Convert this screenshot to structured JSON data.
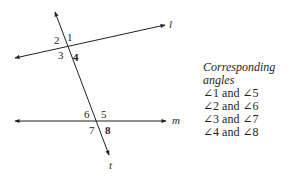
{
  "diagram": {
    "lines": {
      "l": {
        "label": "l"
      },
      "m": {
        "label": "m"
      },
      "t": {
        "label": "t"
      }
    },
    "angle_labels": {
      "a1": "1",
      "a2": "2",
      "a3": "3",
      "a4": "4",
      "a5": "5",
      "a6": "6",
      "a7": "7",
      "a8": "8"
    },
    "colors": {
      "ink": "#231f20"
    }
  },
  "legend": {
    "title": "Corresponding angles",
    "pairs": [
      "∠1 and ∠5",
      "∠2 and ∠6",
      "∠3 and ∠7",
      "∠4 and ∠8"
    ]
  }
}
